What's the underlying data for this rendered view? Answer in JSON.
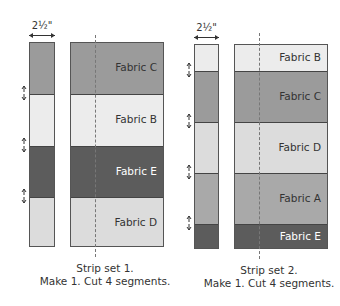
{
  "colors": {
    "fabric_A": "#a9a9a9",
    "fabric_B": "#ececec",
    "fabric_C": "#9b9b9b",
    "fabric_D": "#dcdcdc",
    "fabric_E": "#5c5c5c",
    "label_dark": "#333333",
    "label_light": "#ffffff"
  },
  "strip_sets": [
    {
      "dimension": "2½\"",
      "bands": [
        {
          "label": "Fabric C"
        },
        {
          "label": "Fabric B"
        },
        {
          "label": "Fabric E"
        },
        {
          "label": "Fabric D"
        }
      ],
      "caption_line1": "Strip set 1.",
      "caption_line2": "Make 1. Cut 4 segments."
    },
    {
      "dimension": "2½\"",
      "bands": [
        {
          "label": "Fabric B"
        },
        {
          "label": "Fabric C"
        },
        {
          "label": "Fabric D"
        },
        {
          "label": "Fabric A"
        },
        {
          "label": "Fabric E"
        }
      ],
      "caption_line1": "Strip set 2.",
      "caption_line2": "Make 1. Cut 4 segments."
    }
  ]
}
